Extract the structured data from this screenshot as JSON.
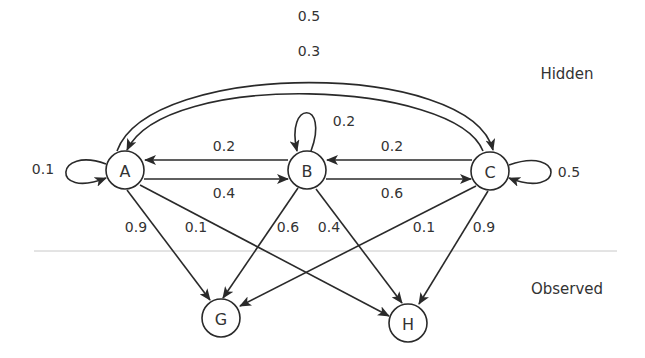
{
  "layers": {
    "hidden_label": "Hidden",
    "observed_label": "Observed"
  },
  "nodes": {
    "A": {
      "label": "A",
      "layer": "hidden"
    },
    "B": {
      "label": "B",
      "layer": "hidden"
    },
    "C": {
      "label": "C",
      "layer": "hidden"
    },
    "G": {
      "label": "G",
      "layer": "observed"
    },
    "H": {
      "label": "H",
      "layer": "observed"
    }
  },
  "transitions": {
    "A_A": "0.1",
    "A_B": "0.4",
    "A_C": "0.5",
    "B_A": "0.2",
    "B_B": "0.2",
    "B_C": "0.6",
    "C_A": "0.3",
    "C_B": "0.2",
    "C_C": "0.5"
  },
  "emissions": {
    "A_G": "0.9",
    "A_H": "0.1",
    "B_G": "0.6",
    "B_H": "0.4",
    "C_G": "0.1",
    "C_H": "0.9"
  },
  "colors": {
    "stroke": "#2a2a2a",
    "separator": "#c8c8c8",
    "text": "#333333"
  }
}
